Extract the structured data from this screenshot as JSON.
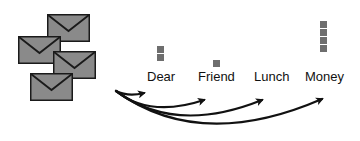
{
  "diagram": {
    "colors": {
      "envelope_fill": "#8a8a8a",
      "envelope_stroke": "#1a1a1a",
      "count_square": "#6e6e6e",
      "arrow": "#111111"
    },
    "envelopes": [
      {
        "id": "envelope-1",
        "x": 47,
        "y": 14
      },
      {
        "id": "envelope-2",
        "x": 18,
        "y": 36
      },
      {
        "id": "envelope-3",
        "x": 53,
        "y": 51
      },
      {
        "id": "envelope-4",
        "x": 30,
        "y": 73
      }
    ],
    "words": [
      {
        "label": "Dear",
        "count": 2
      },
      {
        "label": "Friend",
        "count": 1
      },
      {
        "label": "Lunch",
        "count": 0
      },
      {
        "label": "Money",
        "count": 4
      }
    ]
  }
}
